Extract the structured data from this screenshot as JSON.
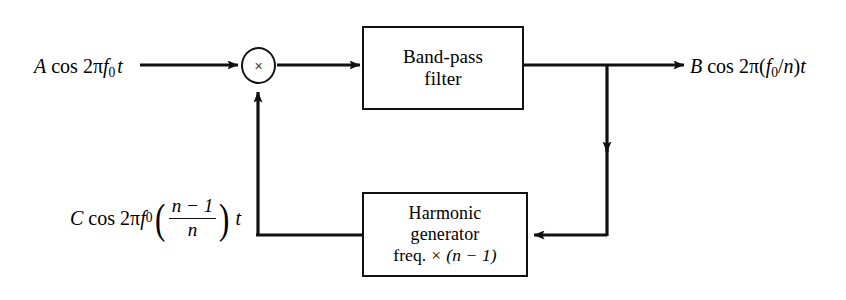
{
  "diagram": {
    "background_color": "#ffffff",
    "line_color": "#111111"
  },
  "blocks": {
    "bandpass": {
      "name": "Band-pass filter",
      "line1": "Band-pass",
      "line2": "filter"
    },
    "harmonic": {
      "name": "Harmonic generator",
      "line1": "Harmonic",
      "line2": "generator",
      "line3_prefix": "freq.",
      "line3_times": "×",
      "line3_expr": "(n − 1)"
    },
    "multiplier": {
      "name": "multiplier",
      "symbol": "×"
    }
  },
  "labels": {
    "input": {
      "amplitude": "A",
      "cos": "cos",
      "two_pi": "2π",
      "freq": "f",
      "freq_sub": "0",
      "time": "t"
    },
    "output": {
      "amplitude": "B",
      "cos": "cos",
      "two_pi": "2π",
      "open": "(",
      "freq": "f",
      "freq_sub": "0",
      "divide": "/",
      "n": "n",
      "close": ")",
      "time": "t"
    },
    "feedback": {
      "amplitude": "C",
      "cos": "cos",
      "two_pi": "2π",
      "freq": "f",
      "freq_sub": "0",
      "numerator": "n − 1",
      "denominator": "n",
      "time": "t"
    }
  }
}
